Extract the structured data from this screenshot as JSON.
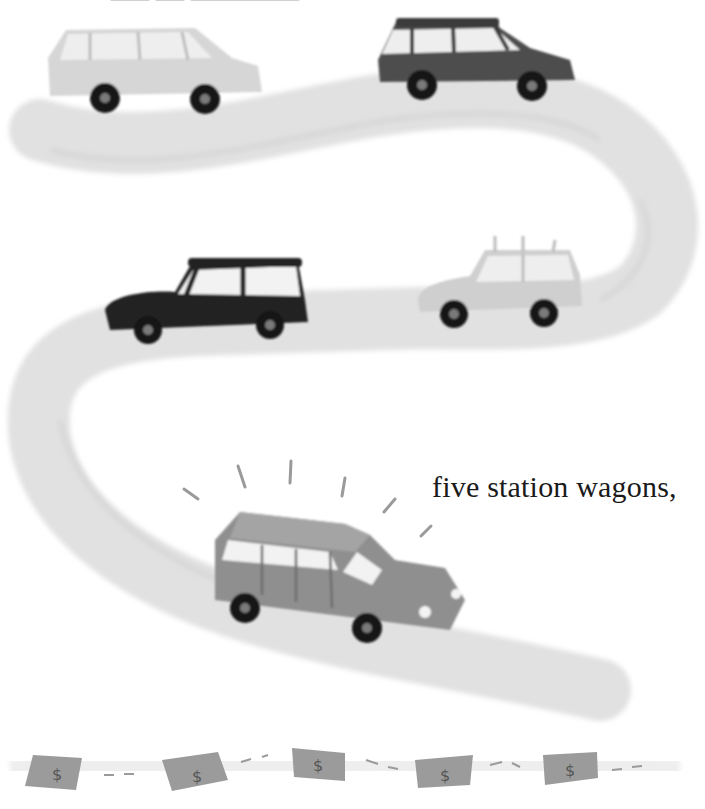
{
  "page": {
    "caption": "five station wagons,",
    "top_text_clipped": true
  },
  "illustration": {
    "style": "grayscale painted children's book illustration",
    "road": {
      "shape": "winding S-curve road",
      "color": "#e2e2e2"
    },
    "cars": [
      {
        "id": 1,
        "type": "station wagon",
        "shade": "light gray",
        "color": "#d3d3d3",
        "position": "top-left"
      },
      {
        "id": 2,
        "type": "station wagon",
        "shade": "dark gray",
        "color": "#4a4a4a",
        "position": "top-right"
      },
      {
        "id": 3,
        "type": "station wagon",
        "shade": "black",
        "color": "#222222",
        "position": "middle-left"
      },
      {
        "id": 4,
        "type": "station wagon with roof rack",
        "shade": "light gray",
        "color": "#cdcdcd",
        "position": "middle-right"
      },
      {
        "id": 5,
        "type": "station wagon, highlighted with shine rays",
        "shade": "medium gray",
        "color": "#8e8e8e",
        "position": "bottom-center"
      }
    ],
    "money_bills": [
      {
        "symbol": "$"
      },
      {
        "symbol": "$"
      },
      {
        "symbol": "$"
      },
      {
        "symbol": "$"
      },
      {
        "symbol": "$"
      }
    ]
  },
  "colors": {
    "background": "#ffffff",
    "road": "#e0e0e0",
    "tire": "#111111",
    "hub": "#777777",
    "window": "#f4f4f4",
    "bill": "#9a9a9a",
    "text": "#1a1a1a"
  }
}
